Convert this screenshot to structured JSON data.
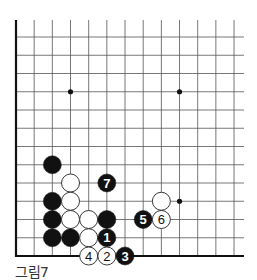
{
  "caption": "그림7",
  "board": {
    "columns": 13,
    "rows": 13,
    "origin_x": 16,
    "bottom_y": 256,
    "spacing_x": 18.17,
    "spacing_y": 18.25,
    "top_extent_y": 20,
    "right_extent_x": 244,
    "stone_radius": 9,
    "colors": {
      "line": "#555555",
      "edge": "#111111",
      "black_stone": "#111111",
      "white_stone": "#ffffff",
      "white_stroke": "#222222"
    },
    "star_points": [
      {
        "col": 3,
        "row": 9
      },
      {
        "col": 9,
        "row": 9
      },
      {
        "col": 9,
        "row": 3
      }
    ],
    "stones": [
      {
        "color": "black",
        "col": 2,
        "row": 5,
        "label": ""
      },
      {
        "color": "white",
        "col": 3,
        "row": 4,
        "label": ""
      },
      {
        "color": "black",
        "col": 5,
        "row": 4,
        "label": "7"
      },
      {
        "color": "black",
        "col": 2,
        "row": 3,
        "label": ""
      },
      {
        "color": "white",
        "col": 3,
        "row": 3,
        "label": ""
      },
      {
        "color": "white",
        "col": 8,
        "row": 3,
        "label": ""
      },
      {
        "color": "black",
        "col": 2,
        "row": 2,
        "label": ""
      },
      {
        "color": "white",
        "col": 3,
        "row": 2,
        "label": ""
      },
      {
        "color": "white",
        "col": 4,
        "row": 2,
        "label": ""
      },
      {
        "color": "black",
        "col": 5,
        "row": 2,
        "label": ""
      },
      {
        "color": "black",
        "col": 7,
        "row": 2,
        "label": "5"
      },
      {
        "color": "white",
        "col": 8,
        "row": 2,
        "label": "6"
      },
      {
        "color": "black",
        "col": 2,
        "row": 1,
        "label": ""
      },
      {
        "color": "black",
        "col": 3,
        "row": 1,
        "label": ""
      },
      {
        "color": "white",
        "col": 4,
        "row": 1,
        "label": ""
      },
      {
        "color": "black",
        "col": 5,
        "row": 1,
        "label": "1"
      },
      {
        "color": "white",
        "col": 4,
        "row": 0,
        "label": "4"
      },
      {
        "color": "white",
        "col": 5,
        "row": 0,
        "label": "2"
      },
      {
        "color": "black",
        "col": 6,
        "row": 0,
        "label": "3"
      }
    ]
  }
}
